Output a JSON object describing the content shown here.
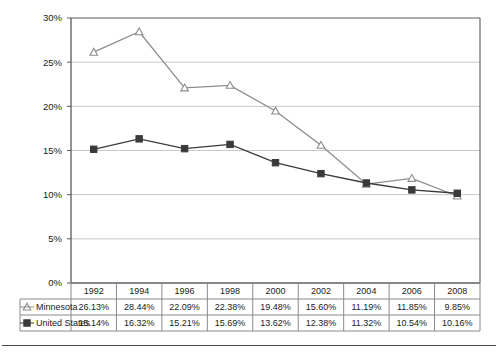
{
  "chart_data": {
    "type": "line",
    "title": "",
    "xlabel": "",
    "ylabel": "",
    "categories": [
      "1992",
      "1994",
      "1996",
      "1998",
      "2000",
      "2002",
      "2004",
      "2006",
      "2008"
    ],
    "series": [
      {
        "name": "Minnesota",
        "marker": "open-triangle",
        "color": "#8c8c8c",
        "values": [
          26.13,
          28.44,
          22.09,
          22.38,
          19.48,
          15.6,
          11.19,
          11.85,
          9.85
        ],
        "labels": [
          "26.13%",
          "28.44%",
          "22.09%",
          "22.38%",
          "19.48%",
          "15.60%",
          "11.19%",
          "11.85%",
          "9.85%"
        ]
      },
      {
        "name": "United States",
        "marker": "filled-square",
        "color": "#3a3a3a",
        "values": [
          15.14,
          16.32,
          15.21,
          15.69,
          13.62,
          12.38,
          11.32,
          10.54,
          10.16
        ],
        "labels": [
          "15.14%",
          "16.32%",
          "15.21%",
          "15.69%",
          "13.62%",
          "12.38%",
          "11.32%",
          "10.54%",
          "10.16%"
        ]
      }
    ],
    "ylim": [
      0,
      30
    ],
    "yticks": [
      0,
      5,
      10,
      15,
      20,
      25,
      30
    ],
    "ytick_labels": [
      "0%",
      "5%",
      "10%",
      "15%",
      "20%",
      "25%",
      "30%"
    ],
    "grid": "horizontal",
    "legend_position": "data-table-left",
    "gridline_color": "#c8c8c8",
    "axis_color": "#5a5a5a",
    "table_border_color": "#8a8a8a"
  },
  "data_table": {
    "header_row": [
      "",
      "1992",
      "1994",
      "1996",
      "1998",
      "2000",
      "2002",
      "2004",
      "2006",
      "2008"
    ],
    "rows": [
      {
        "label": "Minnesota",
        "marker": "open-triangle",
        "cells": [
          "26.13%",
          "28.44%",
          "22.09%",
          "22.38%",
          "19.48%",
          "15.60%",
          "11.19%",
          "11.85%",
          "9.85%"
        ]
      },
      {
        "label": "United States",
        "marker": "filled-square",
        "cells": [
          "15.14%",
          "16.32%",
          "15.21%",
          "15.69%",
          "13.62%",
          "12.38%",
          "11.32%",
          "10.54%",
          "10.16%"
        ]
      }
    ]
  }
}
